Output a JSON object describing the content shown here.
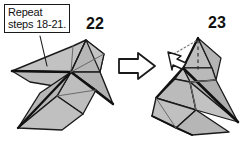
{
  "diagram": {
    "background_color": "#ffffff",
    "paper_fill": "#b9b9b9",
    "paper_fill_light": "#c6c6c6",
    "paper_fill_dark": "#a8a8a8",
    "line_color": "#1a1a1a",
    "arrow_fill": "#ffffff"
  },
  "callout": {
    "line1": "Repeat",
    "line2": "steps 18-21.",
    "leader_label": "leader-line"
  },
  "steps": {
    "left": {
      "number": "22",
      "caption": "Model after repeating steps 18-21"
    },
    "right": {
      "number": "23",
      "caption": "Model with head flap folded"
    }
  },
  "arrows": {
    "transition": {
      "name": "process-arrow",
      "direction": "right",
      "style": "hollow-outline"
    },
    "fold": {
      "name": "fold-arrow",
      "direction": "up-left",
      "style": "hollow-outline-with-dotted-path"
    }
  },
  "fold_lines": {
    "head_crease": "vertical-dashed",
    "dotted_guide": "diagonal-dotted"
  }
}
